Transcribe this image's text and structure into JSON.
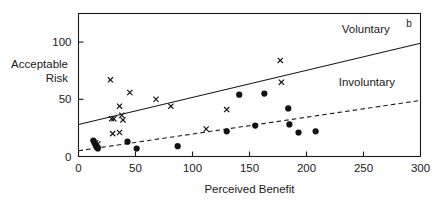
{
  "chart_data": {
    "type": "scatter",
    "title": "",
    "xlabel": "Perceived Benefit",
    "ylabel_line1": "Acceptable",
    "ylabel_line2": "Risk",
    "xlim": [
      0,
      300
    ],
    "ylim": [
      0,
      125
    ],
    "xticks": [
      0,
      50,
      100,
      150,
      200,
      250,
      300
    ],
    "xtick_labels": [
      "0",
      "50",
      "100",
      "150",
      "200",
      "250",
      "300"
    ],
    "yticks": [
      0,
      50,
      100
    ],
    "ytick_labels": [
      "0",
      "50",
      "100"
    ],
    "grid": false,
    "legend_position": "inline-right",
    "annotations": [
      {
        "name": "panel-letter",
        "text": "b",
        "x": 290,
        "y": 113
      }
    ],
    "series": [
      {
        "name": "Voluntary",
        "label": "Voluntary",
        "marker": "x",
        "line_style": "solid",
        "line_label_x": 252,
        "line_label_y": 108,
        "fit_line": {
          "x0": 0,
          "y0": 28,
          "x1": 300,
          "y1": 99
        },
        "points": [
          {
            "x": 15,
            "y": 12
          },
          {
            "x": 17,
            "y": 11
          },
          {
            "x": 28,
            "y": 67
          },
          {
            "x": 29,
            "y": 33
          },
          {
            "x": 31,
            "y": 33
          },
          {
            "x": 30,
            "y": 20
          },
          {
            "x": 36,
            "y": 21
          },
          {
            "x": 36,
            "y": 44
          },
          {
            "x": 38,
            "y": 36
          },
          {
            "x": 39,
            "y": 32
          },
          {
            "x": 45,
            "y": 56
          },
          {
            "x": 68,
            "y": 50
          },
          {
            "x": 81,
            "y": 44
          },
          {
            "x": 112,
            "y": 24
          },
          {
            "x": 130,
            "y": 41
          },
          {
            "x": 177,
            "y": 84
          },
          {
            "x": 178,
            "y": 65
          }
        ]
      },
      {
        "name": "Involuntary",
        "label": "Involuntary",
        "marker": "circle",
        "line_style": "dashed",
        "line_label_x": 253,
        "line_label_y": 62,
        "fit_line": {
          "x0": 0,
          "y0": 5,
          "x1": 300,
          "y1": 49
        },
        "points": [
          {
            "x": 13,
            "y": 14
          },
          {
            "x": 14,
            "y": 12
          },
          {
            "x": 15,
            "y": 10
          },
          {
            "x": 16,
            "y": 8
          },
          {
            "x": 17,
            "y": 7
          },
          {
            "x": 43,
            "y": 13
          },
          {
            "x": 51,
            "y": 7
          },
          {
            "x": 87,
            "y": 9
          },
          {
            "x": 130,
            "y": 22
          },
          {
            "x": 141,
            "y": 54
          },
          {
            "x": 155,
            "y": 27
          },
          {
            "x": 163,
            "y": 55
          },
          {
            "x": 184,
            "y": 42
          },
          {
            "x": 185,
            "y": 28
          },
          {
            "x": 193,
            "y": 21
          },
          {
            "x": 208,
            "y": 22
          }
        ]
      }
    ]
  }
}
